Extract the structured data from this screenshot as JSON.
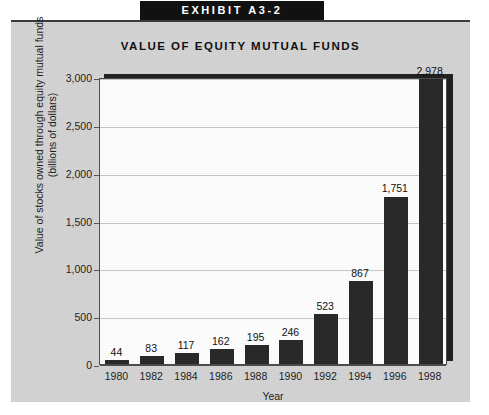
{
  "exhibit": {
    "label": "EXHIBIT A3-2"
  },
  "chart_data": {
    "type": "bar",
    "title": "VALUE OF EQUITY MUTUAL FUNDS",
    "xlabel": "Year",
    "ylabel": "Value of stocks owned through equity mutual funds (billions of dollars)",
    "ylabel_line1": "Value of stocks owned through equity mutual funds",
    "ylabel_line2": "(billions of dollars)",
    "categories": [
      "1980",
      "1982",
      "1984",
      "1986",
      "1988",
      "1990",
      "1992",
      "1994",
      "1996",
      "1998"
    ],
    "values": [
      44,
      83,
      117,
      162,
      195,
      246,
      523,
      867,
      1751,
      2978
    ],
    "value_labels": [
      "44",
      "83",
      "117",
      "162",
      "195",
      "246",
      "523",
      "867",
      "1,751",
      "2,978"
    ],
    "ylim": [
      0,
      3000
    ],
    "ytick_values": [
      0,
      500,
      1000,
      1500,
      2000,
      2500,
      3000
    ],
    "ytick_labels": [
      "0",
      "500",
      "1,000",
      "1,500",
      "2,000",
      "2,500",
      "3,000"
    ],
    "grid": true,
    "legend": null,
    "bar_color": "#262626",
    "plot_background": "#ffffff",
    "panel_background": "#d4d4d4"
  }
}
